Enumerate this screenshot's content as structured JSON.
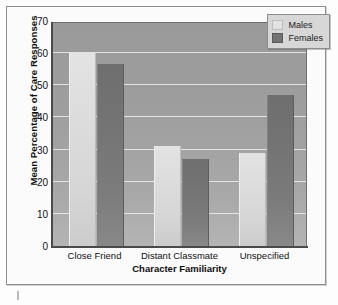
{
  "chart_data": {
    "type": "bar",
    "title": "",
    "xlabel": "Character Familiarity",
    "ylabel": "Mean Percentage of Care Responses",
    "categories": [
      "Close Friend",
      "Distant Classmate",
      "Unspecified"
    ],
    "series": [
      {
        "name": "Males",
        "values": [
          60,
          31,
          29
        ],
        "color": "#dedede"
      },
      {
        "name": "Females",
        "values": [
          56.5,
          27,
          47
        ],
        "color": "#737373"
      }
    ],
    "ylim": [
      0,
      70
    ],
    "yticks": [
      0,
      10,
      20,
      30,
      40,
      50,
      60,
      70
    ],
    "ytick_labels": [
      "0",
      "10",
      "20",
      "30",
      "40",
      "50",
      "60",
      "70"
    ],
    "grid": true,
    "grid_axis": "y",
    "grid_color": "#e9e9e9",
    "legend": {
      "position": "top-right",
      "entries": [
        {
          "label": "Males",
          "swatch": "males"
        },
        {
          "label": "Females",
          "swatch": "females"
        }
      ]
    },
    "plot_background": "#9e9e9e",
    "axis_color": "#4a4a4a"
  }
}
